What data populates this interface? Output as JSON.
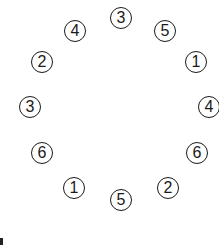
{
  "diagram": {
    "type": "ring-of-numbered-circles",
    "nodes": [
      {
        "label": "3",
        "x": 121,
        "y": 18
      },
      {
        "label": "5",
        "x": 165,
        "y": 31
      },
      {
        "label": "1",
        "x": 196,
        "y": 62
      },
      {
        "label": "4",
        "x": 209,
        "y": 107
      },
      {
        "label": "6",
        "x": 197,
        "y": 153
      },
      {
        "label": "2",
        "x": 168,
        "y": 188
      },
      {
        "label": "5",
        "x": 121,
        "y": 200
      },
      {
        "label": "1",
        "x": 74,
        "y": 188
      },
      {
        "label": "6",
        "x": 42,
        "y": 153
      },
      {
        "label": "3",
        "x": 30,
        "y": 107
      },
      {
        "label": "2",
        "x": 42,
        "y": 62
      },
      {
        "label": "4",
        "x": 75,
        "y": 31
      }
    ]
  }
}
